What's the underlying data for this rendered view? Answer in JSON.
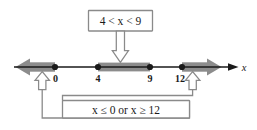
{
  "figure": {
    "title_box": {
      "text": "4 < x < 9",
      "parts": {
        "left_value": "4",
        "left_relation": "<",
        "variable": "x",
        "right_relation": "<",
        "right_value": "9"
      }
    },
    "bottom_box": {
      "text": "x ≤ 0   or   x ≥ 12",
      "parts": {
        "first_variable": "x",
        "first_relation": "≤",
        "first_value": "0",
        "conjunction": "or",
        "second_variable": "x",
        "second_relation": "≥",
        "second_value": "12"
      }
    },
    "number_line": {
      "axis_label": "x",
      "tick_labels": [
        "0",
        "4",
        "9",
        "12"
      ],
      "tick_values": [
        0,
        4,
        9,
        12
      ],
      "points": [
        {
          "label": "0",
          "value": 0,
          "marker": "closed-dot"
        },
        {
          "label": "4",
          "value": 4,
          "marker": "closed-dot"
        },
        {
          "label": "9",
          "value": 9,
          "marker": "closed-dot"
        },
        {
          "label": "12",
          "value": 12,
          "marker": "closed-dot"
        }
      ],
      "highlighted_regions": [
        {
          "name": "left-ray",
          "from": "-infinity",
          "to": "0",
          "style": "gray-arrow-left"
        },
        {
          "name": "middle-segment",
          "from": "4",
          "to": "9",
          "style": "gray-bar"
        },
        {
          "name": "right-ray",
          "from": "12",
          "to": "+infinity",
          "style": "gray-arrow-right"
        }
      ]
    },
    "colors": {
      "highlight_gray": "#8c8c8c",
      "line_black": "#1a1a1a",
      "connector_gray": "#8a8a8a",
      "box_fill": "#ffffff"
    }
  }
}
